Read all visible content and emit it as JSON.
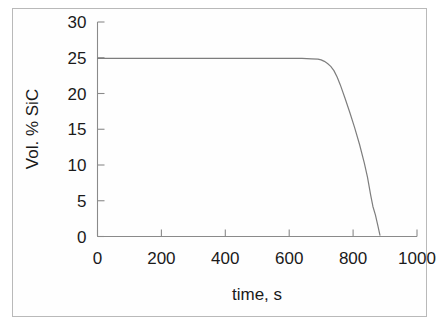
{
  "figure": {
    "background_color": "#ffffff",
    "border_color": "#b9b9b9",
    "line_color": "#7d7d7d",
    "axis_color": "#8a8a8a",
    "text_color": "#1a1a1a"
  },
  "chart_data": {
    "type": "line",
    "title": "",
    "subtitle": "",
    "xlabel": "time, s",
    "ylabel": "Vol. % SiC",
    "xlim": [
      0,
      1000
    ],
    "ylim": [
      0,
      30
    ],
    "xticks": [
      0,
      200,
      400,
      600,
      800,
      1000
    ],
    "yticks": [
      0,
      5,
      10,
      15,
      20,
      25,
      30
    ],
    "xtick_labels": [
      "0",
      "200",
      "400",
      "600",
      "800",
      "1000"
    ],
    "ytick_labels": [
      "0",
      "5",
      "10",
      "15",
      "20",
      "25",
      "30"
    ],
    "grid": false,
    "legend": null,
    "legend_position": "none",
    "annotations": [],
    "series": [
      {
        "name": "Vol. % SiC",
        "color": "#7d7d7d",
        "x": [
          0,
          50,
          100,
          150,
          200,
          250,
          300,
          350,
          400,
          450,
          500,
          550,
          600,
          640,
          670,
          690,
          700,
          710,
          720,
          730,
          740,
          750,
          760,
          775,
          790,
          805,
          820,
          835,
          845,
          855,
          862,
          870,
          878,
          884
        ],
        "y": [
          24.9,
          24.9,
          24.9,
          24.9,
          24.9,
          24.9,
          24.9,
          24.9,
          24.9,
          24.9,
          24.9,
          24.9,
          24.9,
          24.9,
          24.85,
          24.8,
          24.7,
          24.5,
          24.2,
          23.8,
          23.2,
          22.3,
          21.2,
          19.3,
          17.3,
          15.2,
          12.9,
          10.3,
          8.3,
          5.8,
          4.2,
          3.0,
          1.4,
          0.2
        ]
      }
    ]
  }
}
